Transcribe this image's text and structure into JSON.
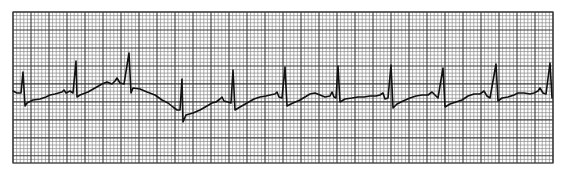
{
  "figure": {
    "title": "ECG rhythm strip",
    "background_color": "#ffffff",
    "grid_color_minor": "#8a8a8a",
    "grid_color_major": "#3a3a3a",
    "trace_color": "#111111"
  },
  "chart_data": {
    "type": "line",
    "title": "",
    "xlabel": "",
    "ylabel": "",
    "grid": {
      "on": true,
      "plot_area_px": {
        "x": 13,
        "y": 12,
        "width": 540,
        "height": 151
      },
      "minor_square_px": 3.6,
      "major_every_minor": 5,
      "major_square_px": 18,
      "large_boxes_horizontal": 30,
      "large_boxes_vertical": 8.4
    },
    "beats": {
      "count": 11,
      "r_wave_x_px": [
        23,
        76,
        129,
        182,
        233,
        285,
        338,
        391,
        443,
        496,
        550
      ],
      "r_wave_peak_y_px": [
        72,
        61,
        53,
        79,
        70,
        67,
        66,
        65,
        68,
        64,
        63
      ],
      "s_wave_trough_y_px": [
        106,
        97,
        93,
        122,
        110,
        106,
        102,
        108,
        107,
        101,
        98
      ],
      "mean_rr_interval_large_boxes": 2.9,
      "estimated_rate_bpm": 103,
      "rhythm": "regular"
    },
    "trace_points": [
      [
        13,
        91
      ],
      [
        17,
        93
      ],
      [
        21,
        93
      ],
      [
        23,
        72
      ],
      [
        25,
        106
      ],
      [
        27,
        103
      ],
      [
        33,
        100
      ],
      [
        40,
        99
      ],
      [
        46,
        97
      ],
      [
        50,
        95
      ],
      [
        55,
        94
      ],
      [
        62,
        92
      ],
      [
        64,
        90
      ],
      [
        66,
        93
      ],
      [
        70,
        91
      ],
      [
        73,
        93
      ],
      [
        76,
        61
      ],
      [
        77,
        97
      ],
      [
        80,
        95
      ],
      [
        88,
        92
      ],
      [
        95,
        88
      ],
      [
        102,
        84
      ],
      [
        107,
        82
      ],
      [
        112,
        84
      ],
      [
        115,
        81
      ],
      [
        117,
        78
      ],
      [
        120,
        83
      ],
      [
        124,
        84
      ],
      [
        129,
        53
      ],
      [
        131,
        93
      ],
      [
        133,
        88
      ],
      [
        140,
        89
      ],
      [
        147,
        92
      ],
      [
        155,
        95
      ],
      [
        162,
        100
      ],
      [
        168,
        103
      ],
      [
        173,
        107
      ],
      [
        177,
        110
      ],
      [
        180,
        110
      ],
      [
        182,
        79
      ],
      [
        183,
        122
      ],
      [
        186,
        115
      ],
      [
        193,
        113
      ],
      [
        200,
        110
      ],
      [
        207,
        106
      ],
      [
        212,
        103
      ],
      [
        216,
        102
      ],
      [
        220,
        99
      ],
      [
        222,
        97
      ],
      [
        224,
        101
      ],
      [
        228,
        102
      ],
      [
        231,
        103
      ],
      [
        233,
        70
      ],
      [
        235,
        110
      ],
      [
        240,
        107
      ],
      [
        247,
        103
      ],
      [
        254,
        99
      ],
      [
        260,
        97
      ],
      [
        266,
        96
      ],
      [
        270,
        95
      ],
      [
        275,
        94
      ],
      [
        277,
        92
      ],
      [
        279,
        97
      ],
      [
        282,
        98
      ],
      [
        285,
        67
      ],
      [
        287,
        106
      ],
      [
        293,
        103
      ],
      [
        300,
        100
      ],
      [
        305,
        97
      ],
      [
        310,
        94
      ],
      [
        315,
        93
      ],
      [
        320,
        95
      ],
      [
        325,
        97
      ],
      [
        330,
        96
      ],
      [
        332,
        92
      ],
      [
        334,
        97
      ],
      [
        336,
        98
      ],
      [
        338,
        66
      ],
      [
        340,
        102
      ],
      [
        345,
        99
      ],
      [
        352,
        98
      ],
      [
        358,
        97
      ],
      [
        364,
        97
      ],
      [
        370,
        96
      ],
      [
        376,
        96
      ],
      [
        380,
        95
      ],
      [
        383,
        93
      ],
      [
        385,
        99
      ],
      [
        388,
        98
      ],
      [
        391,
        65
      ],
      [
        393,
        108
      ],
      [
        397,
        104
      ],
      [
        403,
        101
      ],
      [
        410,
        98
      ],
      [
        416,
        96
      ],
      [
        422,
        95
      ],
      [
        428,
        95
      ],
      [
        432,
        92
      ],
      [
        435,
        95
      ],
      [
        438,
        98
      ],
      [
        443,
        68
      ],
      [
        445,
        107
      ],
      [
        450,
        104
      ],
      [
        456,
        102
      ],
      [
        462,
        100
      ],
      [
        468,
        96
      ],
      [
        474,
        94
      ],
      [
        480,
        94
      ],
      [
        484,
        91
      ],
      [
        487,
        96
      ],
      [
        490,
        98
      ],
      [
        496,
        64
      ],
      [
        498,
        101
      ],
      [
        502,
        98
      ],
      [
        508,
        97
      ],
      [
        514,
        95
      ],
      [
        518,
        93
      ],
      [
        524,
        93
      ],
      [
        530,
        94
      ],
      [
        534,
        93
      ],
      [
        538,
        91
      ],
      [
        540,
        88
      ],
      [
        543,
        93
      ],
      [
        546,
        94
      ],
      [
        550,
        63
      ],
      [
        552,
        98
      ]
    ]
  }
}
